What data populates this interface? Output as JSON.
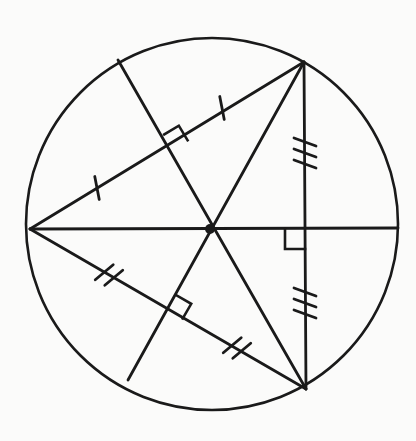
{
  "figure": {
    "type": "geometry-diagram",
    "canvas": {
      "width": 416,
      "height": 441
    },
    "colors": {
      "stroke": "#1a1a1a",
      "background": "#fbfbfa",
      "vertex_dot": "#1a1a1a"
    },
    "stroke_widths": {
      "circle": 2.6,
      "segment": 2.8,
      "tick": 2.8,
      "right_angle": 2.6
    }
  },
  "circle": {
    "label": "circumscribed-circle",
    "cx": 212,
    "cy": 224,
    "r": 186
  },
  "points": {
    "center": {
      "label": "circumcenter",
      "x": 210,
      "y": 229
    },
    "vertex_left": {
      "label": "vertex-A-left",
      "x": 30,
      "y": 229
    },
    "vertex_top_right": {
      "label": "vertex-B-top-right",
      "x": 304,
      "y": 62
    },
    "vertex_bottom_right": {
      "label": "vertex-C-bottom-right",
      "x": 306,
      "y": 389
    },
    "chord_end_upper_left": {
      "label": "chord-endpoint-upper-left",
      "x": 118,
      "y": 60
    },
    "chord_end_lower_left": {
      "label": "chord-endpoint-lower-left",
      "x": 128,
      "y": 380
    },
    "midpoint_upper": {
      "label": "midpoint-side-AB",
      "x": 173,
      "y": 149
    },
    "midpoint_lower": {
      "label": "midpoint-side-AC",
      "x": 168,
      "y": 310
    },
    "midpoint_right": {
      "label": "midpoint-side-BC",
      "x": 305,
      "y": 229
    },
    "circle_right": {
      "label": "circle-point-right",
      "x": 398,
      "y": 228
    }
  },
  "segments": [
    {
      "name": "triangle-side-AB",
      "x1": 30,
      "y1": 229,
      "x2": 304,
      "y2": 62,
      "ticks": 1
    },
    {
      "name": "triangle-side-AC",
      "x1": 30,
      "y1": 229,
      "x2": 306,
      "y2": 389,
      "ticks": 2
    },
    {
      "name": "triangle-side-BC",
      "x1": 304,
      "y1": 62,
      "x2": 306,
      "y2": 389,
      "ticks": 3
    },
    {
      "name": "radius-to-center-horizontal",
      "x1": 30,
      "y1": 229,
      "x2": 398,
      "y2": 228,
      "ticks": 0
    },
    {
      "name": "bisector-chord-upper",
      "x1": 118,
      "y1": 60,
      "x2": 306,
      "y2": 389,
      "ticks": 0
    },
    {
      "name": "bisector-chord-lower",
      "x1": 128,
      "y1": 380,
      "x2": 304,
      "y2": 62,
      "ticks": 0
    }
  ],
  "tick_marks": [
    {
      "name": "tick-side-AB-left",
      "count": 1,
      "x": 97,
      "y": 188,
      "angle": -31
    },
    {
      "name": "tick-side-AB-right",
      "count": 1,
      "x": 222,
      "y": 108,
      "angle": -31
    },
    {
      "name": "tick-side-AC-left",
      "count": 2,
      "x": 109,
      "y": 275,
      "angle": 30
    },
    {
      "name": "tick-side-AC-right",
      "count": 2,
      "x": 237,
      "y": 348,
      "angle": 30
    },
    {
      "name": "tick-side-BC-upper",
      "count": 3,
      "x": 305,
      "y": 153,
      "angle": 90
    },
    {
      "name": "tick-side-BC-lower",
      "count": 3,
      "x": 305,
      "y": 303,
      "angle": 90
    }
  ],
  "right_angle_marks": [
    {
      "name": "right-angle-midpoint-AB",
      "x": 173,
      "y": 149,
      "angle": -31,
      "size": 17
    },
    {
      "name": "right-angle-midpoint-AC",
      "x": 168,
      "y": 310,
      "angle": 30,
      "size": 17
    },
    {
      "name": "right-angle-midpoint-BC",
      "x": 305,
      "y": 229,
      "angle": 180,
      "size": 20
    }
  ],
  "annotations": {
    "center_dot_radius": 5,
    "tick_length": 22,
    "tick_spacing": 11
  }
}
